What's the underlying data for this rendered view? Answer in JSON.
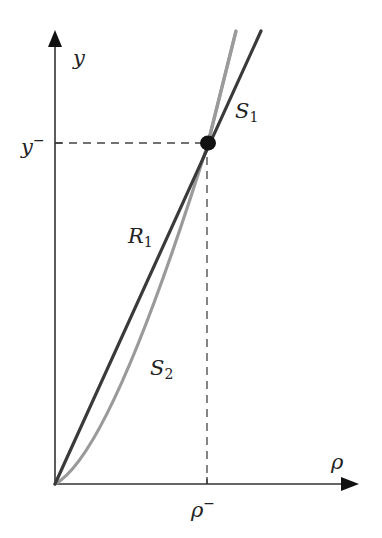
{
  "colors": {
    "axis": "#333333",
    "line_R1": "#3a3a3a",
    "curve_S2": "#9a9a9a",
    "dashed": "#444444",
    "point": "#111111",
    "background": "#ffffff"
  },
  "axes": {
    "x_label": "ρ",
    "y_label": "y"
  },
  "ticks": {
    "x_tick_base": "ρ",
    "x_tick_sup": "−",
    "y_tick_base": "y",
    "y_tick_sup": "−"
  },
  "curves": {
    "R1_base": "R",
    "R1_sub": "1",
    "S2_base": "S",
    "S2_sub": "2",
    "S1_base": "S",
    "S1_sub": "1"
  },
  "geometry": {
    "origin": [
      55,
      484
    ],
    "x_axis_end": [
      359,
      484
    ],
    "y_axis_end": [
      55,
      30
    ],
    "intersection": [
      208,
      143
    ],
    "R1_end": [
      261,
      31
    ],
    "S2_end": [
      236,
      31
    ]
  }
}
